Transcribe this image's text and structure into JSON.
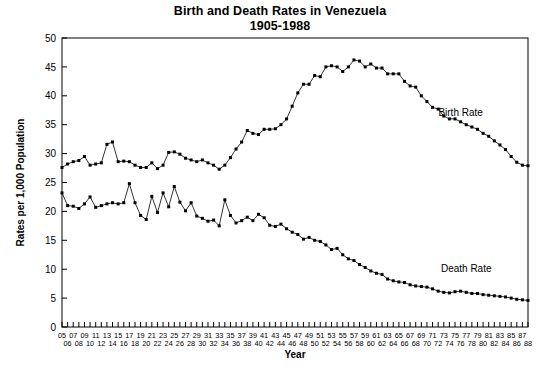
{
  "chart_data": {
    "type": "line",
    "title": "Birth and Death Rates in Venezuela",
    "subtitle": "1905-1988",
    "xlabel": "Year",
    "ylabel": "Rates per 1,000 Population",
    "ylim": [
      0,
      50
    ],
    "ytick_step": 5,
    "yticks": [
      0,
      5,
      10,
      15,
      20,
      25,
      30,
      35,
      40,
      45,
      50
    ],
    "grid": false,
    "legend_position": "inline-annotation",
    "marker": "filled-square",
    "x": [
      1905,
      1906,
      1907,
      1908,
      1909,
      1910,
      1911,
      1912,
      1913,
      1914,
      1915,
      1916,
      1917,
      1918,
      1919,
      1920,
      1921,
      1922,
      1923,
      1924,
      1925,
      1926,
      1927,
      1928,
      1929,
      1930,
      1931,
      1932,
      1933,
      1934,
      1935,
      1936,
      1937,
      1938,
      1939,
      1940,
      1941,
      1942,
      1943,
      1944,
      1945,
      1946,
      1947,
      1948,
      1949,
      1950,
      1951,
      1952,
      1953,
      1954,
      1955,
      1956,
      1957,
      1958,
      1959,
      1960,
      1961,
      1962,
      1963,
      1964,
      1965,
      1966,
      1967,
      1968,
      1969,
      1970,
      1971,
      1972,
      1973,
      1974,
      1975,
      1976,
      1977,
      1978,
      1979,
      1980,
      1981,
      1982,
      1983,
      1984,
      1985,
      1986,
      1987,
      1988
    ],
    "xtick_labels": [
      "05",
      "06",
      "07",
      "08",
      "09",
      "10",
      "11",
      "12",
      "13",
      "14",
      "15",
      "16",
      "17",
      "18",
      "19",
      "20",
      "21",
      "22",
      "23",
      "24",
      "25",
      "26",
      "27",
      "28",
      "29",
      "30",
      "31",
      "32",
      "33",
      "34",
      "35",
      "36",
      "37",
      "38",
      "39",
      "40",
      "41",
      "42",
      "43",
      "44",
      "45",
      "46",
      "47",
      "48",
      "49",
      "50",
      "51",
      "52",
      "53",
      "54",
      "55",
      "56",
      "57",
      "58",
      "59",
      "60",
      "61",
      "62",
      "63",
      "64",
      "65",
      "66",
      "67",
      "68",
      "69",
      "70",
      "71",
      "72",
      "73",
      "74",
      "75",
      "76",
      "77",
      "78",
      "79",
      "80",
      "81",
      "82",
      "83",
      "84",
      "85",
      "86",
      "87",
      "88"
    ],
    "series": [
      {
        "name": "Birth Rate",
        "label": "Birth Rate",
        "color": "#000000",
        "annotation_x": 1976,
        "annotation_y": 36.5,
        "values": [
          27.6,
          28.2,
          28.6,
          28.8,
          29.5,
          28.0,
          28.2,
          28.4,
          31.6,
          32.0,
          28.6,
          28.7,
          28.6,
          28.0,
          27.6,
          27.6,
          28.4,
          27.4,
          28.0,
          30.2,
          30.3,
          29.9,
          29.2,
          28.9,
          28.6,
          28.9,
          28.4,
          28.0,
          27.3,
          28.0,
          29.3,
          30.8,
          32.0,
          34.0,
          33.5,
          33.3,
          34.2,
          34.2,
          34.3,
          35.0,
          36.0,
          38.2,
          40.5,
          42.0,
          42.0,
          43.5,
          43.3,
          45.0,
          45.2,
          45.0,
          44.2,
          45.0,
          46.2,
          46.0,
          45.0,
          45.5,
          44.8,
          44.8,
          43.8,
          43.8,
          43.8,
          42.5,
          41.7,
          41.5,
          40.0,
          39.0,
          38.0,
          37.7,
          36.5,
          36.0,
          36.0,
          35.5,
          35.0,
          34.6,
          34.2,
          33.5,
          33.0,
          32.2,
          31.5,
          30.7,
          29.5,
          28.5,
          28.0,
          27.9
        ]
      },
      {
        "name": "Death Rate",
        "label": "Death Rate",
        "color": "#000000",
        "annotation_x": 1977,
        "annotation_y": 9.5,
        "values": [
          23.2,
          21.0,
          20.9,
          20.5,
          21.3,
          22.5,
          20.7,
          21.0,
          21.3,
          21.5,
          21.3,
          21.5,
          24.8,
          21.5,
          19.3,
          18.6,
          22.6,
          19.8,
          23.2,
          20.8,
          24.3,
          21.6,
          20.1,
          21.5,
          19.2,
          18.8,
          18.3,
          18.5,
          17.5,
          22.0,
          19.3,
          18.0,
          18.4,
          19.0,
          18.4,
          19.5,
          18.9,
          17.6,
          17.4,
          17.8,
          17.0,
          16.4,
          16.0,
          15.2,
          15.5,
          15.0,
          14.8,
          14.2,
          13.4,
          13.6,
          12.5,
          11.8,
          11.5,
          10.8,
          10.3,
          9.7,
          9.3,
          9.1,
          8.3,
          8.0,
          7.8,
          7.7,
          7.3,
          7.1,
          7.0,
          6.9,
          6.6,
          6.2,
          6.0,
          5.9,
          6.1,
          6.2,
          6.0,
          5.8,
          5.8,
          5.6,
          5.5,
          5.4,
          5.3,
          5.2,
          5.0,
          4.8,
          4.7,
          4.6
        ]
      }
    ]
  }
}
